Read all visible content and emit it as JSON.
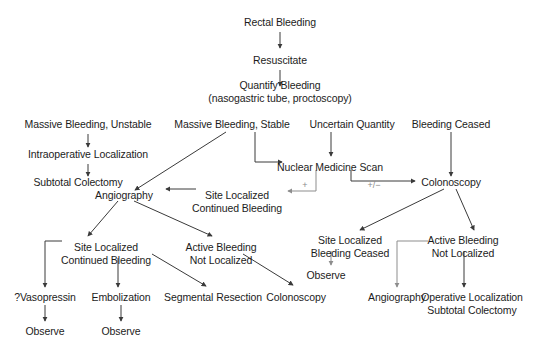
{
  "diagram": {
    "background_color": "#ffffff",
    "text_color": "#1c1c1c",
    "arrow_color": "#3a3a3a",
    "edge_label_color": "#8a8a8a",
    "nodes": [
      {
        "id": "rectal-bleeding",
        "line1": "Rectal Bleeding",
        "line2": "",
        "x": 280,
        "y": 16
      },
      {
        "id": "resuscitate",
        "line1": "Resuscitate",
        "line2": "",
        "x": 280,
        "y": 54
      },
      {
        "id": "quantify-bleeding",
        "line1": "Quantify Bleeding",
        "line2": "(nasogastric tube, proctoscopy)",
        "x": 280,
        "y": 79
      },
      {
        "id": "massive-bleeding-unstable",
        "line1": "Massive Bleeding, Unstable",
        "line2": "",
        "x": 88,
        "y": 118
      },
      {
        "id": "massive-bleeding-stable",
        "line1": "Massive Bleeding, Stable",
        "line2": "",
        "x": 232,
        "y": 118
      },
      {
        "id": "uncertain-quantity",
        "line1": "Uncertain Quantity",
        "line2": "",
        "x": 352,
        "y": 118
      },
      {
        "id": "bleeding-ceased",
        "line1": "Bleeding Ceased",
        "line2": "",
        "x": 451,
        "y": 118
      },
      {
        "id": "intraoperative-localization",
        "line1": "Intraoperative Localization",
        "line2": "",
        "x": 88,
        "y": 148
      },
      {
        "id": "nuclear-medicine-scan",
        "line1": "Nuclear Medicine Scan",
        "line2": "",
        "x": 330,
        "y": 161
      },
      {
        "id": "subtotal-colectomy-left",
        "line1": "Subtotal Colectomy",
        "line2": "",
        "x": 78,
        "y": 176
      },
      {
        "id": "colonoscopy-right",
        "line1": "Colonoscopy",
        "line2": "",
        "x": 451,
        "y": 176
      },
      {
        "id": "angiography-mid",
        "line1": "Angiography",
        "line2": "",
        "x": 124,
        "y": 189
      },
      {
        "id": "site-localized-continued-bleeding-mid",
        "line1": "Site Localized",
        "line2": "Continued Bleeding",
        "x": 237,
        "y": 189
      },
      {
        "id": "site-localized-continued-bleeding-low",
        "line1": "Site Localized",
        "line2": "Continued Bleeding",
        "x": 106,
        "y": 241
      },
      {
        "id": "active-bleeding-not-localized-mid",
        "line1": "Active Bleeding",
        "line2": "Not Localized",
        "x": 221,
        "y": 241
      },
      {
        "id": "site-localized-bleeding-ceased",
        "line1": "Site Localized",
        "line2": "Bleeding Ceased",
        "x": 350,
        "y": 234
      },
      {
        "id": "active-bleeding-not-localized-right",
        "line1": "Active Bleeding",
        "line2": "Not Localized",
        "x": 463,
        "y": 234
      },
      {
        "id": "vasopressin",
        "line1": "?Vasopressin",
        "line2": "",
        "x": 45,
        "y": 291
      },
      {
        "id": "embolization",
        "line1": "Embolization",
        "line2": "",
        "x": 121,
        "y": 291
      },
      {
        "id": "segmental-resection",
        "line1": "Segmental Resection",
        "line2": "",
        "x": 213,
        "y": 291
      },
      {
        "id": "colonoscopy-bottom",
        "line1": "Colonoscopy",
        "line2": "",
        "x": 296,
        "y": 291
      },
      {
        "id": "observe-ceased",
        "line1": "Observe",
        "line2": "",
        "x": 326,
        "y": 269
      },
      {
        "id": "angiography-right",
        "line1": "Angiography",
        "line2": "",
        "x": 397,
        "y": 291
      },
      {
        "id": "operative-localization",
        "line1": "Operative Localization",
        "line2": "Subtotal Colectomy",
        "x": 472,
        "y": 291
      },
      {
        "id": "observe-vasopressin",
        "line1": "Observe",
        "line2": "",
        "x": 45,
        "y": 325
      },
      {
        "id": "observe-embolization",
        "line1": "Observe",
        "line2": "",
        "x": 121,
        "y": 325
      }
    ],
    "edge_labels": [
      {
        "id": "plus-label",
        "text": "+",
        "x": 305,
        "y": 180
      },
      {
        "id": "plus-minus-label",
        "text": "+/−",
        "x": 374,
        "y": 180
      }
    ]
  }
}
